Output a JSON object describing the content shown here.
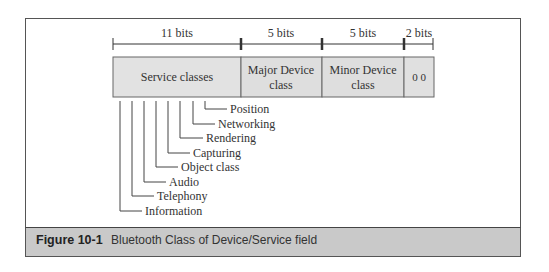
{
  "bit_widths": [
    {
      "label": "11 bits"
    },
    {
      "label": "5 bits"
    },
    {
      "label": "5 bits"
    },
    {
      "label": "2 bits"
    }
  ],
  "fields": [
    {
      "line1": "Service classes",
      "line2": ""
    },
    {
      "line1": "Major Device",
      "line2": "class"
    },
    {
      "line1": "Minor Device",
      "line2": "class"
    },
    {
      "line1": "0 0",
      "line2": ""
    }
  ],
  "service_bits": [
    {
      "label": "Position"
    },
    {
      "label": "Networking"
    },
    {
      "label": "Rendering"
    },
    {
      "label": "Capturing"
    },
    {
      "label": "Object class"
    },
    {
      "label": "Audio"
    },
    {
      "label": "Telephony"
    },
    {
      "label": "Information"
    }
  ],
  "caption": {
    "number": "Figure 10-1",
    "text": "Bluetooth Class of Device/Service field"
  },
  "colors": {
    "field_fill": "#e0e0e0",
    "caption_bar": "#c9c9c9",
    "line": "#444444"
  }
}
